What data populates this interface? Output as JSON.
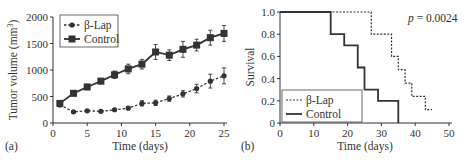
{
  "chart_data": [
    {
      "panel": "(a)",
      "type": "line",
      "title": "",
      "xlabel": "Time (days)",
      "ylabel": "Tumor volume (mm3)",
      "xlim": [
        0,
        25
      ],
      "ylim": [
        0,
        2000
      ],
      "xticks": [
        0,
        5,
        10,
        15,
        20,
        25
      ],
      "yticks": [
        0,
        500,
        1000,
        1500,
        2000
      ],
      "grid": false,
      "legend_position": "upper left",
      "x": [
        1,
        3,
        5,
        7,
        9,
        11,
        13,
        15,
        17,
        19,
        21,
        23,
        25
      ],
      "series": [
        {
          "name": "β-Lap",
          "style": "dashed, circle markers",
          "values": [
            340,
            210,
            230,
            220,
            250,
            280,
            370,
            380,
            460,
            550,
            650,
            790,
            890
          ],
          "errors": [
            30,
            20,
            20,
            20,
            20,
            25,
            50,
            50,
            50,
            60,
            80,
            130,
            150
          ]
        },
        {
          "name": "Control",
          "style": "solid, square markers",
          "values": [
            370,
            560,
            680,
            790,
            910,
            1020,
            1110,
            1340,
            1280,
            1390,
            1470,
            1610,
            1690
          ],
          "errors": [
            30,
            40,
            50,
            50,
            70,
            90,
            90,
            140,
            100,
            150,
            110,
            140,
            150
          ]
        }
      ]
    },
    {
      "panel": "(b)",
      "type": "line",
      "subtype": "kaplan-meier step",
      "title": "",
      "xlabel": "Time (days)",
      "ylabel": "Survival",
      "xlim": [
        0,
        50
      ],
      "ylim": [
        0,
        1.0
      ],
      "xticks": [
        0,
        10,
        20,
        30,
        40,
        50
      ],
      "yticks": [
        0,
        0.2,
        0.4,
        0.6,
        0.8,
        1.0
      ],
      "grid": false,
      "legend_position": "lower left",
      "annotation": "p = 0.0024",
      "series": [
        {
          "name": "β-Lap",
          "style": "dashed",
          "steps": [
            [
              0,
              1.0
            ],
            [
              27,
              0.8
            ],
            [
              33,
              0.6
            ],
            [
              35,
              0.48
            ],
            [
              37,
              0.36
            ],
            [
              39,
              0.24
            ],
            [
              43,
              0.12
            ],
            [
              45,
              0.12
            ]
          ]
        },
        {
          "name": "Control",
          "style": "solid",
          "steps": [
            [
              0,
              1.0
            ],
            [
              15,
              0.8
            ],
            [
              19,
              0.7
            ],
            [
              23,
              0.5
            ],
            [
              25,
              0.3
            ],
            [
              29,
              0.2
            ],
            [
              35,
              0.0
            ]
          ]
        }
      ]
    }
  ],
  "labels": {
    "panel_a": "(a)",
    "panel_b": "(b)",
    "a_xlabel": "Time (days)",
    "a_ylabel": "Tumor volume (mm",
    "a_ylabel_sup": "3",
    "a_ylabel_end": ")",
    "b_xlabel": "Time (days)",
    "b_ylabel": "Survival",
    "legend_blap": "β-Lap",
    "legend_control": "Control",
    "p_italic": "p",
    "p_value": " = 0.0024"
  }
}
